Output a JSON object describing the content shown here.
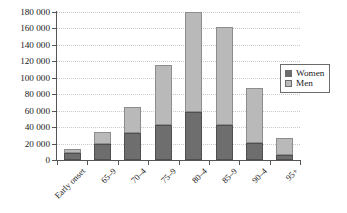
{
  "chart_data": {
    "type": "bar",
    "subtype": "stacked-vertical-bar",
    "title": "",
    "subtitle": "",
    "xlabel": "",
    "ylabel": "",
    "categories": [
      "Early onset",
      "65–9",
      "70–4",
      "75–9",
      "80–4",
      "85–9",
      "90–4",
      "95+"
    ],
    "series": [
      {
        "name": "Women",
        "color": "#6e6e6e",
        "values": [
          9000,
          20000,
          33000,
          42000,
          58000,
          43000,
          21000,
          6000
        ]
      },
      {
        "name": "Men",
        "color": "#b9b9b9",
        "values": [
          5000,
          14000,
          31000,
          73000,
          122000,
          119000,
          66000,
          21000
        ]
      }
    ],
    "totals": [
      14000,
      34000,
      64000,
      115000,
      180000,
      162000,
      87000,
      27000
    ],
    "ylim": [
      0,
      180000
    ],
    "ytick_values": [
      0,
      20000,
      40000,
      60000,
      80000,
      100000,
      120000,
      140000,
      160000,
      180000
    ],
    "ytick_labels": [
      "0",
      "20 000",
      "40 000",
      "60 000",
      "80 000",
      "100 000",
      "120 000",
      "140 000",
      "160 000",
      "180 000"
    ],
    "grid": "horizontal-dotted",
    "legend_position": "right",
    "legend_entries": [
      "Women",
      "Men"
    ],
    "annotations": []
  },
  "legend": {
    "items": [
      {
        "label": "Women",
        "swatch_name": "legend-swatch-women"
      },
      {
        "label": "Men",
        "swatch_name": "legend-swatch-men"
      }
    ]
  }
}
